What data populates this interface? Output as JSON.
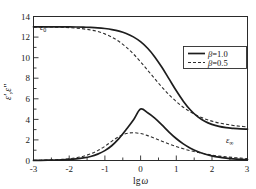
{
  "chart_data": {
    "type": "line",
    "title": "",
    "xlabel": "lg ω",
    "ylabel": "ε′,ε″",
    "xlim": [
      -3,
      3
    ],
    "ylim": [
      0,
      14
    ],
    "grid": false,
    "legend_position": "upper-right",
    "xticks": [
      -3,
      -2,
      -1,
      0,
      1,
      2,
      3
    ],
    "xticklabels": [
      "-3",
      "-2",
      "-1",
      "0",
      "1",
      "2",
      "3"
    ],
    "yticks": [
      0,
      2,
      4,
      6,
      8,
      10,
      12,
      14
    ],
    "yticklabels": [
      "0",
      "2",
      "4",
      "6",
      "8",
      "10",
      "12",
      "14"
    ],
    "x": [
      -3.0,
      -2.8,
      -2.6,
      -2.4,
      -2.2,
      -2.0,
      -1.8,
      -1.6,
      -1.4,
      -1.2,
      -1.0,
      -0.8,
      -0.6,
      -0.4,
      -0.2,
      0.0,
      0.2,
      0.4,
      0.6,
      0.8,
      1.0,
      1.2,
      1.4,
      1.6,
      1.8,
      2.0,
      2.2,
      2.4,
      2.6,
      2.8,
      3.0
    ],
    "series": [
      {
        "name": "ε′, β=1.0",
        "style": "solid",
        "color": "#1d1d1d",
        "values": [
          13.0,
          13.0,
          13.0,
          13.0,
          12.99,
          12.99,
          12.98,
          12.96,
          12.94,
          12.9,
          12.83,
          12.73,
          12.58,
          12.35,
          12.02,
          11.55,
          10.91,
          10.07,
          9.06,
          7.93,
          6.8,
          5.77,
          4.91,
          4.27,
          3.82,
          3.51,
          3.31,
          3.19,
          3.12,
          3.07,
          3.05
        ]
      },
      {
        "name": "ε″, β=1.0",
        "style": "solid",
        "color": "#1d1d1d",
        "values": [
          0.01,
          0.02,
          0.03,
          0.04,
          0.06,
          0.1,
          0.16,
          0.25,
          0.39,
          0.62,
          0.96,
          1.46,
          2.15,
          3.01,
          3.93,
          5.0,
          4.64,
          4.12,
          3.46,
          2.77,
          2.14,
          1.62,
          1.2,
          0.87,
          0.63,
          0.45,
          0.32,
          0.23,
          0.16,
          0.11,
          0.08
        ]
      },
      {
        "name": "ε′, β=0.5",
        "style": "dashed",
        "color": "#2e2e2e",
        "values": [
          12.99,
          12.99,
          12.98,
          12.97,
          12.95,
          12.92,
          12.87,
          12.8,
          12.69,
          12.54,
          12.31,
          11.99,
          11.57,
          11.02,
          10.36,
          9.6,
          8.78,
          7.95,
          7.14,
          6.4,
          5.74,
          5.18,
          4.72,
          4.35,
          4.06,
          3.83,
          3.65,
          3.52,
          3.41,
          3.33,
          3.27
        ]
      },
      {
        "name": "ε″, β=0.5",
        "style": "dashed",
        "color": "#2e2e2e",
        "values": [
          0.02,
          0.03,
          0.05,
          0.07,
          0.11,
          0.17,
          0.27,
          0.42,
          0.64,
          0.96,
          1.38,
          1.88,
          2.34,
          2.62,
          2.7,
          2.62,
          2.42,
          2.16,
          1.88,
          1.61,
          1.36,
          1.14,
          0.95,
          0.79,
          0.65,
          0.53,
          0.43,
          0.35,
          0.29,
          0.23,
          0.19
        ]
      }
    ],
    "annotations": [
      {
        "name": "epsilon-zero",
        "base": "ε",
        "sub": "0",
        "x": -2.72,
        "y": 12.55
      },
      {
        "name": "epsilon-infinity",
        "base": "ε",
        "sub": "∞",
        "x": 2.5,
        "y": 2.35
      }
    ]
  },
  "legend": {
    "entries": [
      {
        "label": "β=1.0",
        "beta": "β",
        "rest": "=1.0",
        "style": "solid"
      },
      {
        "label": "β=0.5",
        "beta": "β",
        "rest": "=0.5",
        "style": "dashed"
      }
    ]
  },
  "axes": {
    "x_title_lg": "lg",
    "x_title_omega": "ω",
    "y_title": "ε′,ε″"
  }
}
